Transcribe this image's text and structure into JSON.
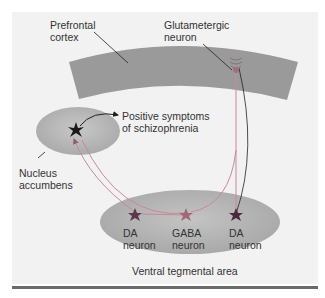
{
  "diagram": {
    "colors": {
      "panel": "#f2f2f2",
      "cortex": "#9a9a9a",
      "region": "#b8b8b8",
      "neuron_pink": "#a05a6e",
      "neuron_dark": "#2a1a2a",
      "pathway": "#c58a9a",
      "rule": "#6b6b6b"
    },
    "labels": {
      "prefrontal_cortex": "Prefrontal\ncortex",
      "glutamatergic_neuron": "Glutametergic\nneuron",
      "positive_symptoms": "Positive symptoms\nof schizophrenia",
      "nucleus_accumbens": "Nucleus\naccumbens",
      "da_neuron_left": "DA\nneuron",
      "gaba_neuron": "GABA\nneuron",
      "da_neuron_right": "DA\nneuron",
      "ventral_tegmental_area": "Ventral tegmental area"
    }
  }
}
